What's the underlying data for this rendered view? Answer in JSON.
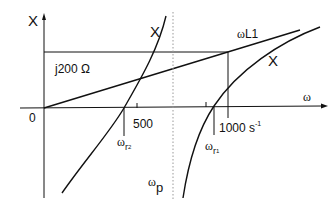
{
  "diagram": {
    "y_axis_label": "X",
    "x_axis_label": "ω",
    "origin_label": "0",
    "reference_line_label": "j200 Ω",
    "line_label_prefix": "ω",
    "line_label": "L1",
    "curve_left_label": "X",
    "curve_right_label": "X",
    "tick_500": "500",
    "tick_1000": "1000 s",
    "tick_1000_sup": "-1",
    "omega_r2": {
      "prefix": "ω",
      "sub": "r",
      "subsub": "2"
    },
    "omega_r1": {
      "prefix": "ω",
      "sub": "r",
      "subsub": "1"
    },
    "omega_p": {
      "prefix": "ω",
      "sub": "p"
    },
    "colors": {
      "stroke": "#111111",
      "dotted": "#999999",
      "background": "#ffffff"
    }
  }
}
